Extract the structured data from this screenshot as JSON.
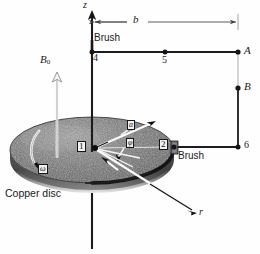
{
  "figure": {
    "kind": "faraday-disc-homopolar-generator-diagram",
    "caption_text": "Copper disc",
    "labels": {
      "z_axis": "z",
      "flux_density": "B",
      "flux_density_sub": "0",
      "dimension_b": "b",
      "brush_top": "Brush",
      "brush_bottom": "Brush",
      "terminal_a": "A",
      "terminal_b": "B",
      "node_1": "1",
      "node_2": "2",
      "node_4": "4",
      "node_5": "5",
      "node_6": "6",
      "angle_alpha": "a",
      "angle_phi": "φ",
      "angular_velocity": "ω",
      "radius_r": "r",
      "disc_name": "Copper disc"
    },
    "colors": {
      "ink": "#15151a",
      "wire": "#1b1b20",
      "disc_dark": "#5f5f5f",
      "disc_light": "#a8a8a8",
      "disc_edge": "#2b2b2b",
      "highlight": "#ffffff",
      "dimension_line": "#4a4a52",
      "background": "#fefefe"
    },
    "geometry": {
      "disc_center": [
        92,
        150
      ],
      "disc_rx": 82,
      "disc_ry": 33,
      "disc_thickness": 13,
      "shaft_x": 92,
      "shaft_top_y": 14,
      "shaft_bottom_y": 249,
      "node_4": [
        92,
        52
      ],
      "node_5": [
        165,
        52
      ],
      "node_2": [
        174,
        147
      ],
      "node_6": [
        238,
        147
      ],
      "terminal_a": [
        238,
        52
      ],
      "terminal_b": [
        238,
        88
      ],
      "dimension_y": 22
    }
  }
}
